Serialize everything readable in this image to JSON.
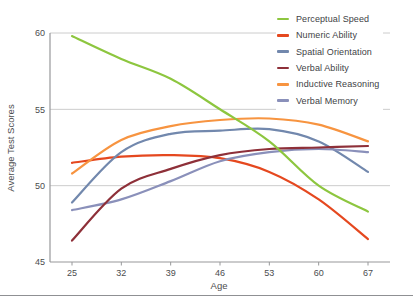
{
  "chart_data": {
    "type": "line",
    "title": "",
    "xlabel": "Age",
    "ylabel": "Average Test Scores",
    "x": [
      25,
      32,
      39,
      46,
      53,
      60,
      67
    ],
    "ylim": [
      45,
      60
    ],
    "yticks": [
      45,
      50,
      55,
      60
    ],
    "xticks": [
      25,
      32,
      39,
      46,
      53,
      60,
      67
    ],
    "grid": "horizontal",
    "legend_position": "top-right",
    "series": [
      {
        "name": "Perceptual Speed",
        "color": "#8dc63f",
        "values": [
          59.8,
          58.3,
          57.0,
          55.0,
          52.9,
          50.0,
          48.3
        ]
      },
      {
        "name": "Numeric Ability",
        "color": "#e5481f",
        "values": [
          51.5,
          51.9,
          52.0,
          51.8,
          50.9,
          49.1,
          46.5
        ]
      },
      {
        "name": "Spatial Orientation",
        "color": "#7288ad",
        "values": [
          48.9,
          52.2,
          53.4,
          53.6,
          53.7,
          52.9,
          50.9
        ]
      },
      {
        "name": "Verbal Ability",
        "color": "#8e3039",
        "values": [
          46.4,
          49.8,
          51.1,
          52.0,
          52.4,
          52.5,
          52.6
        ]
      },
      {
        "name": "Inductive Reasoning",
        "color": "#f79440",
        "values": [
          50.8,
          53.0,
          53.9,
          54.3,
          54.4,
          54.0,
          52.9
        ]
      },
      {
        "name": "Verbal Memory",
        "color": "#8a90ba",
        "values": [
          48.4,
          49.1,
          50.3,
          51.6,
          52.2,
          52.4,
          52.2
        ]
      }
    ]
  },
  "style": {
    "axis_color": "#97989a",
    "grid_color": "#cccccc",
    "text_color": "#4b4c4e",
    "divider_color": "#8f9093",
    "background": "#ffffff"
  }
}
